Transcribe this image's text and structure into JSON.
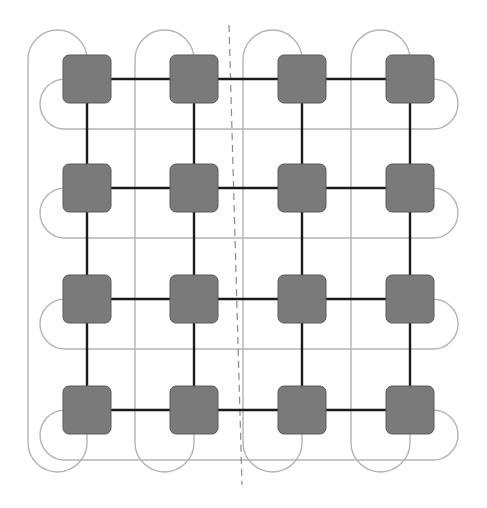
{
  "diagram": {
    "type": "2D torus interconnect (4x4 mesh with wrap-around links)",
    "rows": 4,
    "cols": 4,
    "col_centers": [
      87,
      194,
      302,
      410
    ],
    "row_centers": [
      79,
      188,
      299,
      410
    ],
    "node_size": 48,
    "node_radius": 6,
    "colors": {
      "node_fill": "#7a7a7a",
      "node_stroke": "#5a5a5a",
      "mesh_link": "#1a1a1a",
      "wrap_link": "#b4b4b4",
      "divider": "#8a8a8a",
      "background": "#ffffff"
    },
    "wrap": {
      "vertical_arm_offset": 59,
      "vertical_top_y": 30,
      "vertical_bottom_y": 472,
      "horizontal_arm_offset": 50,
      "horizontal_left_x": 40,
      "horizontal_right_x": 458
    },
    "divider": {
      "x1": 229,
      "y1": 25,
      "x2": 242,
      "y2": 485,
      "style": "dashed"
    }
  }
}
